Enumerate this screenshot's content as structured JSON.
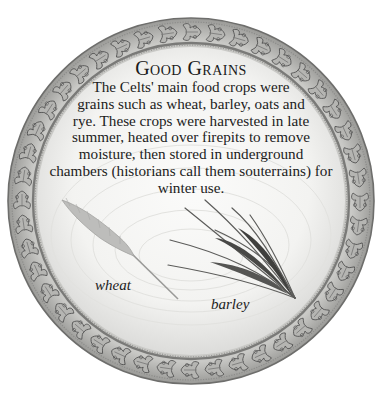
{
  "panel": {
    "title": "Good Grains",
    "body_lines": [
      "The Celts' main food crops were",
      "grains such as wheat, barley, oats and",
      "rye. These crops were harvested in late",
      "summer, heated over firepits to remove",
      "moisture, then stored in underground",
      "chambers (historians call them souterrains) for",
      "winter use."
    ],
    "illustrations": [
      {
        "name": "wheat",
        "label": "wheat"
      },
      {
        "name": "barley",
        "label": "barley"
      }
    ]
  },
  "colors": {
    "background": "#ffffff",
    "plate": "#f4f4f2",
    "border_metal": "#8a8a8a",
    "text": "#1c1c1c"
  }
}
